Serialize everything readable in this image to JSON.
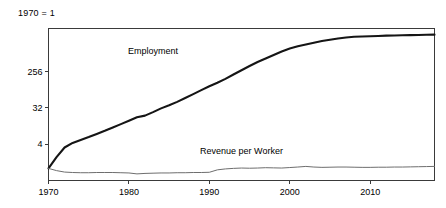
{
  "chart_data": {
    "type": "line",
    "title": "",
    "subtitle": "",
    "unit_note": "1970 = 1",
    "xlabel": "",
    "ylabel": "",
    "yscale": "log",
    "ylim": [
      0.5,
      3000
    ],
    "xlim": [
      1970,
      2018
    ],
    "grid": false,
    "legend_position": "inline-annotation",
    "yticks": [
      4,
      32,
      256
    ],
    "ytick_labels": [
      "4",
      "32",
      "256"
    ],
    "xticks": [
      1970,
      1980,
      1990,
      2000,
      2010
    ],
    "xtick_labels": [
      "1970",
      "1980",
      "1990",
      "2000",
      "2010"
    ],
    "x": [
      1970,
      1971,
      1972,
      1973,
      1974,
      1975,
      1976,
      1977,
      1978,
      1979,
      1980,
      1981,
      1982,
      1983,
      1984,
      1985,
      1986,
      1987,
      1988,
      1989,
      1990,
      1991,
      1992,
      1993,
      1994,
      1995,
      1996,
      1997,
      1998,
      1999,
      2000,
      2001,
      2002,
      2003,
      2004,
      2005,
      2006,
      2007,
      2008,
      2009,
      2010,
      2011,
      2012,
      2013,
      2014,
      2015,
      2016,
      2017,
      2018
    ],
    "series": [
      {
        "name": "Employment",
        "color": "#151515",
        "label_x": 1983,
        "label_y": 700,
        "values": [
          1.0,
          1.9,
          3.3,
          4.3,
          5.1,
          6.0,
          7.2,
          8.6,
          10.4,
          12.6,
          15.3,
          18.6,
          20.5,
          25.0,
          31.0,
          37.0,
          45.0,
          56.0,
          70.0,
          88.0,
          110.0,
          135.0,
          168.0,
          215.0,
          275.0,
          350.0,
          440.0,
          540.0,
          660.0,
          800.0,
          950.0,
          1080.0,
          1200.0,
          1330.0,
          1460.0,
          1580.0,
          1700.0,
          1800.0,
          1870.0,
          1900.0,
          1930.0,
          1960.0,
          1990.0,
          2010.0,
          2030.0,
          2050.0,
          2070.0,
          2090.0,
          2110.0
        ]
      },
      {
        "name": "Revenue per Worker",
        "color": "#6e6e6e",
        "label_x": 1994,
        "label_y": 2.3,
        "values": [
          1.0,
          0.88,
          0.81,
          0.79,
          0.78,
          0.78,
          0.79,
          0.79,
          0.79,
          0.78,
          0.77,
          0.73,
          0.75,
          0.76,
          0.77,
          0.77,
          0.78,
          0.78,
          0.79,
          0.79,
          0.8,
          0.92,
          0.97,
          1.0,
          1.02,
          1.01,
          1.02,
          1.04,
          1.03,
          1.02,
          1.05,
          1.08,
          1.12,
          1.08,
          1.06,
          1.07,
          1.08,
          1.08,
          1.07,
          1.06,
          1.06,
          1.07,
          1.07,
          1.08,
          1.08,
          1.09,
          1.1,
          1.11,
          1.12
        ]
      }
    ]
  },
  "labels": {
    "unit_note": "1970 = 1",
    "employment": "Employment",
    "revenue_per_worker": "Revenue per Worker"
  }
}
